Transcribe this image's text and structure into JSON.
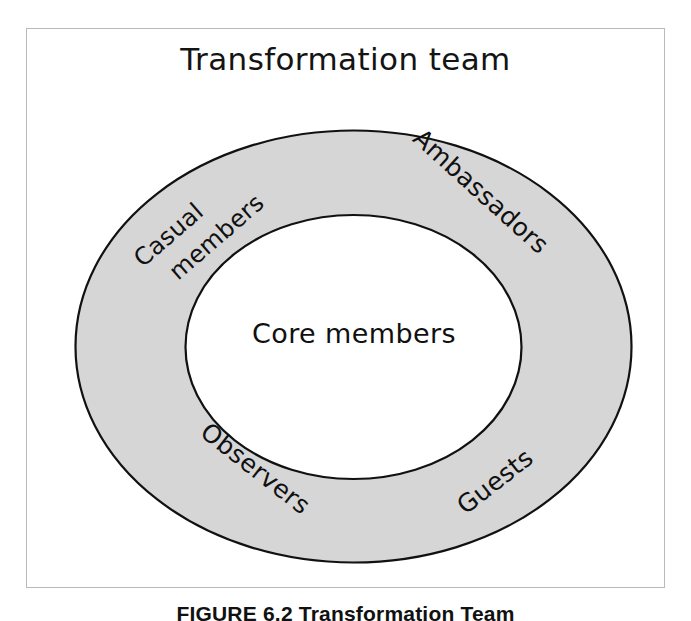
{
  "figure": {
    "title": "Transformation team",
    "caption": "FIGURE 6.2  Transformation Team",
    "frame_color": "#b9b9b9",
    "background_color": "#ffffff"
  },
  "diagram": {
    "type": "concentric-ellipse",
    "ring": {
      "name": "transformation-team-ring",
      "fill_color": "#d6d6d6",
      "stroke_color": "#111111"
    },
    "core": {
      "name": "core-members-ellipse",
      "fill_color": "#ffffff",
      "stroke_color": "#111111",
      "label": "Core members"
    },
    "ring_labels": [
      {
        "id": "casual-members",
        "line_one": "Casual",
        "line_two": "members",
        "position": "upper-left"
      },
      {
        "id": "ambassadors",
        "text": "Ambassadors",
        "position": "upper-right"
      },
      {
        "id": "observers",
        "text": "Observers",
        "position": "lower-left"
      },
      {
        "id": "guests",
        "text": "Guests",
        "position": "lower-right"
      }
    ]
  }
}
